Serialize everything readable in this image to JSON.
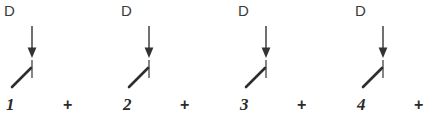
{
  "diagram": {
    "type": "switch-series-expansion",
    "background_color": "#ffffff",
    "stroke_color": "#333333",
    "text_color": "#3a3a3a",
    "groups": [
      {
        "label": "D",
        "number": "1",
        "arrow_icon": "arrow-down-icon",
        "switch_icon": "open-switch-icon",
        "x": 0
      },
      {
        "label": "D",
        "number": "2",
        "arrow_icon": "arrow-down-icon",
        "switch_icon": "open-switch-icon",
        "x": 117
      },
      {
        "label": "D",
        "number": "3",
        "arrow_icon": "arrow-down-icon",
        "switch_icon": "open-switch-icon",
        "x": 234
      },
      {
        "label": "D",
        "number": "4",
        "arrow_icon": "arrow-down-icon",
        "switch_icon": "open-switch-icon",
        "x": 351
      }
    ],
    "operators": [
      {
        "symbol": "+",
        "x": 63
      },
      {
        "symbol": "+",
        "x": 180
      },
      {
        "symbol": "+",
        "x": 297
      },
      {
        "symbol": "+",
        "x": 414
      }
    ]
  }
}
